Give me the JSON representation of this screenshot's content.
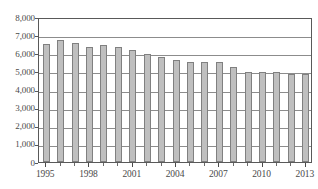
{
  "chart_data": {
    "type": "bar",
    "title": "",
    "subtitle": "",
    "xlabel": "",
    "ylabel": "",
    "categories": [
      "1995",
      "1996",
      "1997",
      "1998",
      "1999",
      "2000",
      "2001",
      "2002",
      "2003",
      "2004",
      "2005",
      "2006",
      "2007",
      "2008",
      "2009",
      "2010",
      "2011",
      "2012",
      "2013"
    ],
    "values": [
      6500,
      6750,
      6570,
      6320,
      6430,
      6370,
      6190,
      5970,
      5800,
      5640,
      5540,
      5540,
      5500,
      5250,
      4960,
      4940,
      4950,
      4850,
      4840
    ],
    "series": [
      {
        "name": "",
        "values": [
          6500,
          6750,
          6570,
          6320,
          6430,
          6370,
          6190,
          5970,
          5800,
          5640,
          5540,
          5540,
          5500,
          5250,
          4960,
          4940,
          4950,
          4850,
          4840
        ]
      }
    ],
    "ylim": [
      0,
      8000
    ],
    "ytick_values": [
      0,
      1000,
      2000,
      3000,
      4000,
      5000,
      6000,
      7000,
      8000
    ],
    "ytick_labels": [
      "0",
      "1,000",
      "2,000",
      "3,000",
      "4,000",
      "5,000",
      "6,000",
      "7,000",
      "8,000"
    ],
    "xtick_labels": [
      "1995",
      "1998",
      "2001",
      "2004",
      "2007",
      "2010",
      "2013"
    ],
    "xtick_categories": [
      "1995",
      "1998",
      "2001",
      "2004",
      "2007",
      "2010",
      "2013"
    ],
    "grid": true,
    "grid_axis": "y",
    "legend": false,
    "legend_position": "none",
    "annotations": [],
    "colors": {
      "bar_fill": "#bfbfbf",
      "bar_border": "#808080",
      "gridline": "#8c8c8c",
      "axis": "#595959",
      "text": "#4a4a4a",
      "background": "#ffffff"
    }
  }
}
